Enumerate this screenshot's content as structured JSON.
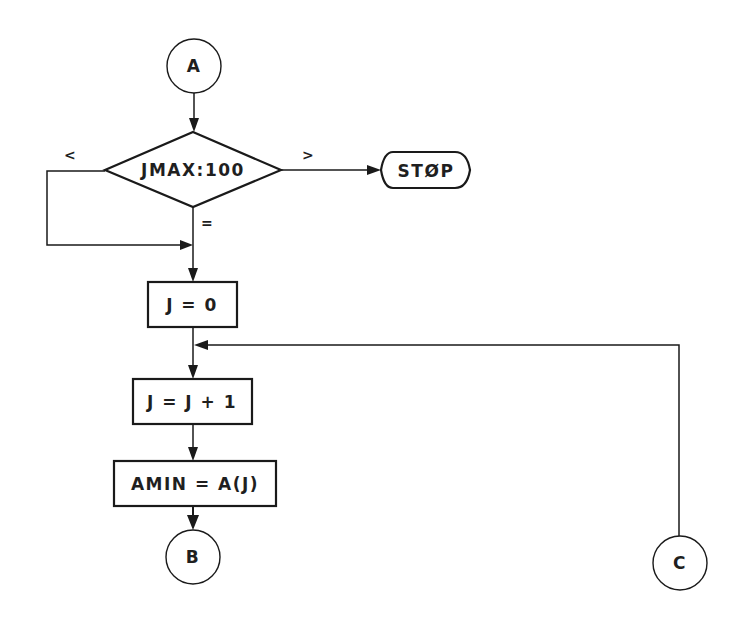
{
  "diagram": {
    "type": "flowchart",
    "connectors": {
      "entry": {
        "label": "A"
      },
      "exit_b": {
        "label": "B"
      },
      "entry_c": {
        "label": "C"
      }
    },
    "decision": {
      "label": "JMAX:100",
      "branch_less": "<",
      "branch_greater": ">",
      "branch_equal": "="
    },
    "terminal": {
      "label": "STØP"
    },
    "processes": [
      {
        "label": "J = 0"
      },
      {
        "label": "J = J + 1"
      },
      {
        "label": "AMIN = A(J)"
      }
    ],
    "colors": {
      "stroke": "#1a1a1a",
      "background": "#ffffff"
    }
  }
}
